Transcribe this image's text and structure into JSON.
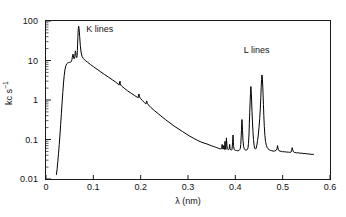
{
  "chart_data": {
    "type": "line",
    "title": "",
    "xlabel": "λ (nm)",
    "ylabel": "kc s⁻¹",
    "ylabel_base": "kc s",
    "ylabel_exponent": "−1",
    "xlim": [
      0,
      0.6
    ],
    "ylim": [
      0.01,
      100
    ],
    "yscale": "log",
    "xscale": "linear",
    "grid": false,
    "legend": null,
    "line_color": "#000000",
    "frame_color": "#1a1a1a",
    "xticks": [
      0,
      0.1,
      0.2,
      0.3,
      0.4,
      0.5,
      0.6
    ],
    "xtick_labels": [
      "0",
      "0.1",
      "0.2",
      "0.3",
      "0.4",
      "0.5",
      "0.6"
    ],
    "yticks": [
      0.01,
      0.1,
      1,
      10,
      100
    ],
    "ytick_labels": [
      "0.01",
      "0.1",
      "1",
      "10",
      "100"
    ],
    "annotations": [
      {
        "text": "K lines",
        "x": 0.085,
        "y": 60.0
      },
      {
        "text": "L lines",
        "x": 0.418,
        "y": 17.0
      }
    ],
    "series": [
      {
        "name": "X-ray emission spectrum",
        "x": [
          0.022,
          0.0235,
          0.025,
          0.0265,
          0.028,
          0.0295,
          0.031,
          0.0325,
          0.034,
          0.0355,
          0.037,
          0.0385,
          0.04,
          0.042,
          0.044,
          0.046,
          0.048,
          0.05,
          0.052,
          0.0535,
          0.0548,
          0.0556,
          0.0562,
          0.057,
          0.0578,
          0.0586,
          0.0594,
          0.06,
          0.0608,
          0.0614,
          0.062,
          0.0628,
          0.0634,
          0.064,
          0.0646,
          0.0652,
          0.0658,
          0.0663,
          0.0668,
          0.0673,
          0.0678,
          0.0684,
          0.069,
          0.07,
          0.0712,
          0.0725,
          0.074,
          0.076,
          0.079,
          0.083,
          0.088,
          0.094,
          0.1,
          0.108,
          0.116,
          0.124,
          0.132,
          0.14,
          0.147,
          0.152,
          0.1548,
          0.1556,
          0.1564,
          0.1572,
          0.158,
          0.16,
          0.165,
          0.172,
          0.18,
          0.187,
          0.193,
          0.1948,
          0.1956,
          0.1964,
          0.1975,
          0.2,
          0.204,
          0.208,
          0.21,
          0.2112,
          0.212,
          0.2128,
          0.214,
          0.217,
          0.222,
          0.229,
          0.237,
          0.245,
          0.253,
          0.262,
          0.27,
          0.279,
          0.288,
          0.296,
          0.304,
          0.312,
          0.32,
          0.328,
          0.334,
          0.34,
          0.345,
          0.35,
          0.3545,
          0.358,
          0.361,
          0.364,
          0.366,
          0.3675,
          0.369,
          0.37,
          0.3712,
          0.3722,
          0.373,
          0.3742,
          0.3752,
          0.376,
          0.3772,
          0.3782,
          0.3792,
          0.38,
          0.3812,
          0.3822,
          0.3832,
          0.3845,
          0.3858,
          0.387,
          0.388,
          0.389,
          0.39,
          0.391,
          0.392,
          0.393,
          0.3942,
          0.3952,
          0.3962,
          0.3975,
          0.399,
          0.4005,
          0.402,
          0.404,
          0.406,
          0.408,
          0.4095,
          0.4105,
          0.4115,
          0.4122,
          0.413,
          0.414,
          0.4152,
          0.4162,
          0.4175,
          0.419,
          0.4205,
          0.422,
          0.4235,
          0.4248,
          0.4258,
          0.4268,
          0.4278,
          0.4288,
          0.4296,
          0.4304,
          0.4312,
          0.432,
          0.4328,
          0.4336,
          0.4344,
          0.4352,
          0.4362,
          0.4372,
          0.4384,
          0.4396,
          0.441,
          0.4425,
          0.444,
          0.4455,
          0.447,
          0.4485,
          0.45,
          0.4515,
          0.4528,
          0.4538,
          0.4546,
          0.4554,
          0.4562,
          0.457,
          0.4578,
          0.4586,
          0.4594,
          0.4602,
          0.4612,
          0.4624,
          0.4638,
          0.4654,
          0.4672,
          0.4692,
          0.4715,
          0.474,
          0.477,
          0.48,
          0.483,
          0.486,
          0.488,
          0.4892,
          0.49,
          0.491,
          0.4922,
          0.494,
          0.497,
          0.5,
          0.504,
          0.508,
          0.512,
          0.515,
          0.5175,
          0.519,
          0.52,
          0.5212,
          0.5226,
          0.525,
          0.529,
          0.533,
          0.537,
          0.541,
          0.545,
          0.549,
          0.553,
          0.556,
          0.56,
          0.564,
          0.565
        ],
        "y": [
          0.013,
          0.018,
          0.028,
          0.045,
          0.075,
          0.13,
          0.24,
          0.45,
          0.85,
          1.55,
          2.7,
          4.2,
          5.8,
          7.4,
          8.3,
          8.7,
          8.9,
          9.0,
          9.1,
          9.4,
          10.5,
          12.0,
          13.5,
          14.5,
          13.0,
          11.5,
          11.0,
          11.2,
          12.5,
          15.0,
          17.5,
          16.0,
          13.5,
          12.2,
          11.8,
          12.0,
          13.5,
          18.0,
          26.0,
          38.0,
          52.0,
          66.0,
          74.0,
          62.0,
          40.0,
          24.0,
          16.5,
          12.8,
          11.2,
          10.0,
          9.0,
          7.9,
          7.0,
          6.0,
          5.1,
          4.4,
          3.8,
          3.25,
          2.85,
          2.55,
          2.42,
          2.85,
          3.0,
          2.6,
          2.38,
          2.25,
          2.0,
          1.72,
          1.48,
          1.3,
          1.17,
          1.14,
          1.35,
          1.42,
          1.2,
          1.08,
          0.96,
          0.86,
          0.81,
          0.79,
          0.9,
          0.95,
          0.82,
          0.74,
          0.64,
          0.54,
          0.45,
          0.375,
          0.315,
          0.262,
          0.222,
          0.188,
          0.16,
          0.139,
          0.121,
          0.107,
          0.095,
          0.086,
          0.081,
          0.077,
          0.073,
          0.069,
          0.066,
          0.064,
          0.062,
          0.06,
          0.059,
          0.058,
          0.058,
          0.057,
          0.06,
          0.075,
          0.062,
          0.057,
          0.07,
          0.058,
          0.056,
          0.09,
          0.062,
          0.056,
          0.11,
          0.072,
          0.058,
          0.056,
          0.055,
          0.058,
          0.075,
          0.058,
          0.055,
          0.054,
          0.054,
          0.056,
          0.085,
          0.13,
          0.07,
          0.056,
          0.054,
          0.053,
          0.053,
          0.052,
          0.052,
          0.053,
          0.056,
          0.06,
          0.075,
          0.11,
          0.18,
          0.32,
          0.17,
          0.095,
          0.066,
          0.058,
          0.055,
          0.054,
          0.054,
          0.055,
          0.057,
          0.062,
          0.08,
          0.13,
          0.25,
          0.48,
          0.85,
          1.45,
          2.2,
          1.6,
          0.95,
          0.52,
          0.28,
          0.16,
          0.1,
          0.072,
          0.06,
          0.057,
          0.06,
          0.072,
          0.095,
          0.13,
          0.2,
          0.34,
          0.62,
          1.15,
          2.1,
          3.3,
          4.3,
          3.6,
          2.4,
          1.4,
          0.76,
          0.4,
          0.215,
          0.128,
          0.09,
          0.072,
          0.063,
          0.058,
          0.055,
          0.053,
          0.052,
          0.051,
          0.051,
          0.053,
          0.058,
          0.07,
          0.062,
          0.055,
          0.052,
          0.051,
          0.05,
          0.049,
          0.049,
          0.048,
          0.048,
          0.047,
          0.048,
          0.052,
          0.062,
          0.055,
          0.049,
          0.047,
          0.046,
          0.046,
          0.045,
          0.045,
          0.044,
          0.044,
          0.043,
          0.043,
          0.042,
          0.042,
          0.042
        ]
      }
    ]
  }
}
